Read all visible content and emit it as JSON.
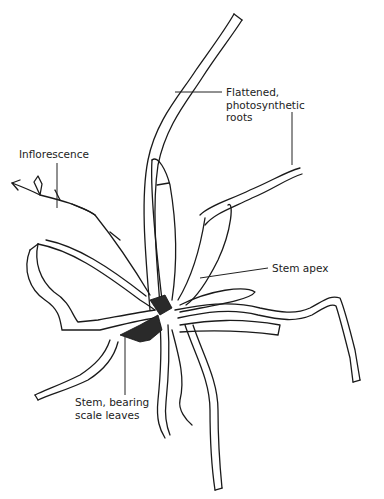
{
  "figure": {
    "labels": [
      {
        "id": "roots",
        "text": "Flattened,\nphotosynthetic\nroots"
      },
      {
        "id": "inflorescence",
        "text": "Inflorescence"
      },
      {
        "id": "stem-apex",
        "text": "Stem apex"
      },
      {
        "id": "stem",
        "text": "Stem, bearing\nscale leaves"
      }
    ]
  }
}
